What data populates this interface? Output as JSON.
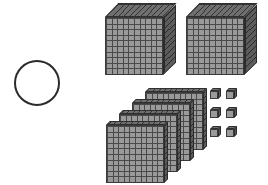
{
  "scene": {
    "title": "Base-ten blocks place value model",
    "background_color": "#ffffff",
    "width": 268,
    "height": 185
  },
  "answer_prompt": {
    "shape": "circle",
    "label": "",
    "state": "empty",
    "stroke_color": "#2b2b2b",
    "x": 14,
    "y": 60,
    "size": 46
  },
  "manipulatives": {
    "colors": {
      "front_face": "#9a9a9a",
      "top_face": "#6f6f6f",
      "side_face": "#5c5c5c",
      "grid_line": "#4a4a4a",
      "outline": "#3a3a3a"
    },
    "groups": [
      {
        "name": "thousands",
        "piece_label": "thousand-cube",
        "place_value": 1000,
        "count": 2,
        "grid": "10 x 10 x 10",
        "subtotal": 2000
      },
      {
        "name": "hundreds",
        "piece_label": "hundred-flat",
        "place_value": 100,
        "count": 4,
        "grid": "10 x 10",
        "subtotal": 400
      },
      {
        "name": "tens",
        "piece_label": "ten-rod",
        "place_value": 10,
        "count": 0,
        "grid": "1 x 10",
        "subtotal": 0
      },
      {
        "name": "ones",
        "piece_label": "unit-cube",
        "place_value": 1,
        "count": 6,
        "grid": "1 x 1",
        "subtotal": 6
      }
    ],
    "total_value": 2406
  },
  "cubes": [
    {
      "id": "thousand-cube-1",
      "x": 105,
      "y": 3,
      "size": 58,
      "depth": 14
    },
    {
      "id": "thousand-cube-2",
      "x": 186,
      "y": 3,
      "size": 58,
      "depth": 14
    }
  ],
  "flats": [
    {
      "id": "hundred-flat-4",
      "x": 145,
      "y": 88,
      "size": 58
    },
    {
      "id": "hundred-flat-3",
      "x": 132,
      "y": 99,
      "size": 58
    },
    {
      "id": "hundred-flat-2",
      "x": 119,
      "y": 110,
      "size": 58
    },
    {
      "id": "hundred-flat-1",
      "x": 106,
      "y": 121,
      "size": 58
    }
  ],
  "units": [
    {
      "id": "unit-cube-1",
      "x": 210,
      "y": 88
    },
    {
      "id": "unit-cube-2",
      "x": 226,
      "y": 88
    },
    {
      "id": "unit-cube-3",
      "x": 210,
      "y": 107
    },
    {
      "id": "unit-cube-4",
      "x": 226,
      "y": 107
    },
    {
      "id": "unit-cube-5",
      "x": 210,
      "y": 126
    },
    {
      "id": "unit-cube-6",
      "x": 226,
      "y": 126
    }
  ]
}
